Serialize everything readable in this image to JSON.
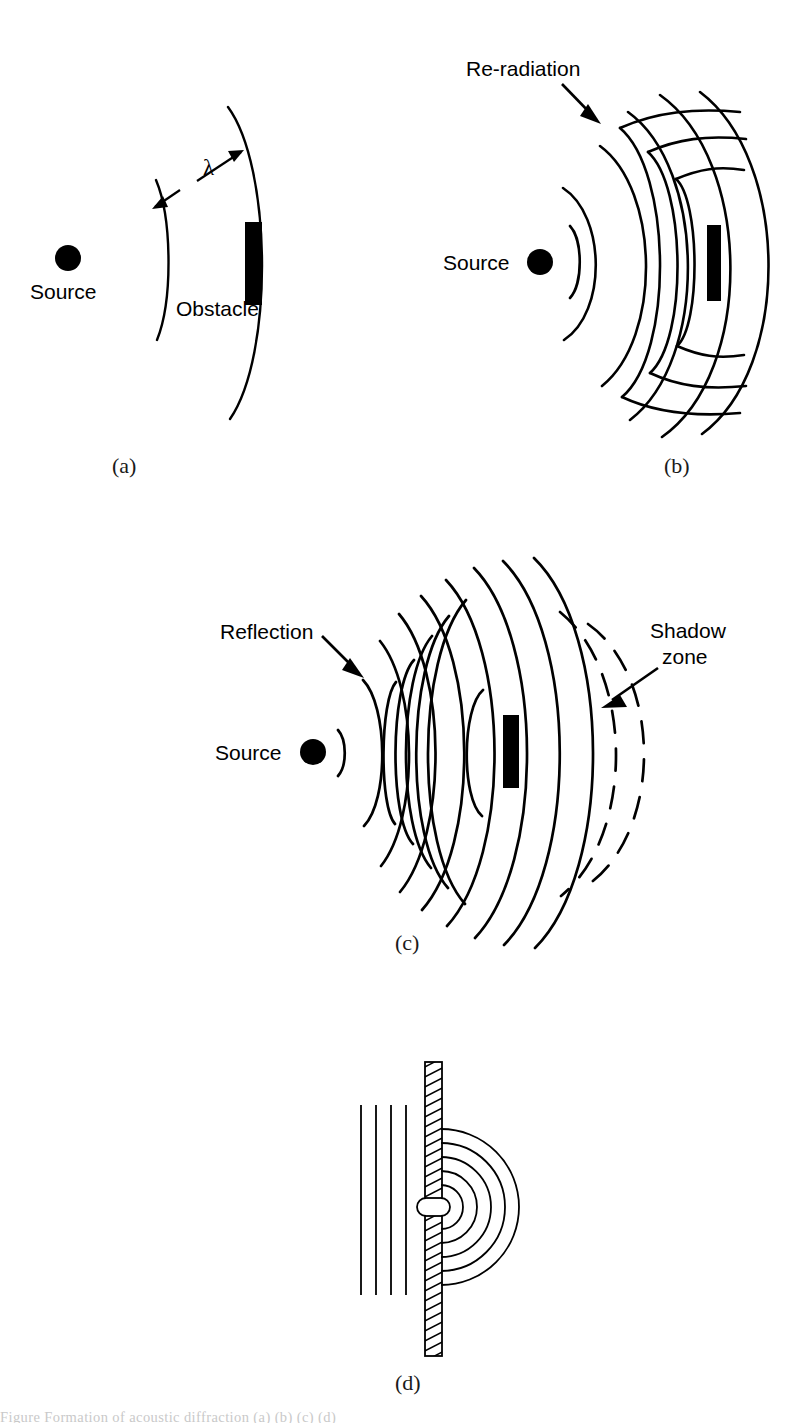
{
  "figure": {
    "background_color": "#ffffff",
    "ink_color": "#000000",
    "width": 810,
    "height": 1423,
    "bottom_caption_fragment": "Figure  Formation of acoustic diffraction  (a)  (b)  (c)  (d)"
  },
  "panels": [
    {
      "id": "a",
      "sublabel": "(a)",
      "description": "Source emitting two wavefronts separated by one wavelength, approaching a small obstacle",
      "labels": {
        "source": "Source",
        "obstacle": "Obstacle",
        "wavelength_symbol": "λ"
      },
      "geometry": {
        "source_center": [
          68,
          258
        ],
        "source_radius": 13,
        "wavefront_count": 2,
        "obstacle_rect": [
          245,
          222,
          17,
          83
        ]
      }
    },
    {
      "id": "b",
      "sublabel": "(b)",
      "description": "Obstacle large compared to wavelength re-radiating the incident wave",
      "labels": {
        "source": "Source",
        "re_radiation": "Re-radiation"
      },
      "geometry": {
        "source_center": [
          540,
          262
        ],
        "source_radius": 13,
        "obstacle_rect": [
          707,
          225,
          14,
          76
        ],
        "reradiation_arc_count": 3
      }
    },
    {
      "id": "c",
      "sublabel": "(c)",
      "description": "Incident wavefronts, backward reflection from the obstacle, and a shadow zone of dashed wavefronts behind it",
      "labels": {
        "source": "Source",
        "reflection": "Reflection",
        "shadow_zone_line1": "Shadow",
        "shadow_zone_line2": "zone"
      },
      "geometry": {
        "source_center": [
          313,
          752
        ],
        "source_radius": 13,
        "obstacle_rect": [
          503,
          715,
          16,
          73
        ],
        "incident_arc_count": 9,
        "reflected_arc_count": 6,
        "shadow_dashed_arc_count": 2
      }
    },
    {
      "id": "d",
      "sublabel": "(d)",
      "description": "Plane wave incident on a rigid hatched barrier with a small aperture, producing circular diffracted wavefronts",
      "labels": {},
      "geometry": {
        "barrier_x": [
          425,
          441
        ],
        "barrier_y": [
          1062,
          1356
        ],
        "aperture_center": [
          441,
          1207
        ],
        "aperture_radius": 9,
        "plane_wave_lines_x": [
          361,
          376,
          391,
          406
        ],
        "plane_wave_y": [
          1105,
          1295
        ],
        "diffracted_radii": [
          9,
          22,
          36,
          50,
          64,
          78
        ]
      }
    }
  ]
}
